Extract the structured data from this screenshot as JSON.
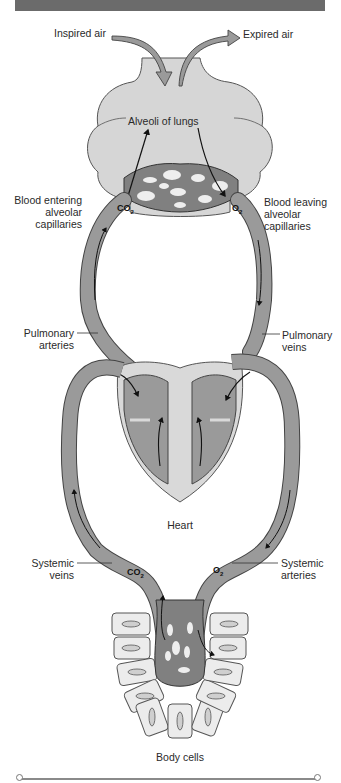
{
  "diagram": {
    "labels": {
      "inspired_air": "Inspired air",
      "expired_air": "Expired air",
      "alveoli": "Alveoli of lungs",
      "blood_entering": [
        "Blood entering",
        "alveolar",
        "capillaries"
      ],
      "blood_leaving": [
        "Blood leaving",
        "alveolar",
        "capillaries"
      ],
      "pulmonary_arteries": [
        "Pulmonary",
        "arteries"
      ],
      "pulmonary_veins": [
        "Pulmonary",
        "veins"
      ],
      "heart": "Heart",
      "systemic_veins": [
        "Systemic",
        "veins"
      ],
      "systemic_arteries": [
        "Systemic",
        "arteries"
      ],
      "body_cells": "Body cells"
    },
    "gases": {
      "co2_lungs": "CO",
      "co2_lungs_sub": "2",
      "o2_lungs": "O",
      "o2_lungs_sub": "2",
      "co2_body": "CO",
      "co2_body_sub": "2",
      "o2_body": "O",
      "o2_body_sub": "2"
    },
    "colors": {
      "header": "#6b6b6b",
      "vessel": "#9a9a9a",
      "vessel_dark": "#7d7d7d",
      "lung": "#d6d6d6",
      "heart_outer": "#d9d9d9",
      "cells": "#ececec",
      "outline": "#444444"
    }
  }
}
